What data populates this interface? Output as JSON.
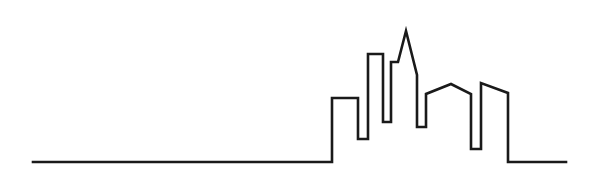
{
  "artwork": {
    "title": "City Skyline Continuous Line Drawing",
    "subject": "city-skyline",
    "style": "single-stroke-outline",
    "background_color": "#ffffff",
    "stroke_color": "#1a1a1a",
    "stroke_width": 2.6,
    "canvas": {
      "width": 609,
      "height": 194
    },
    "ground_line": {
      "label": "ground-baseline",
      "y": 162,
      "x_start": 33,
      "x_end": 566
    },
    "buildings": [
      {
        "name": "flat-low-block",
        "shape": "flat-top rectangle",
        "left_x": 332,
        "right_x": 358,
        "top_y": 98,
        "base_y": 162
      },
      {
        "name": "tall-slim-tower",
        "shape": "flat-top narrow tower",
        "left_x": 368,
        "right_x": 383,
        "top_y": 54,
        "base_y": 139
      },
      {
        "name": "thin-spike-tower",
        "shape": "very narrow flat-top tower",
        "left_x": 391,
        "right_x": 398,
        "top_y": 62,
        "base_y": 122
      },
      {
        "name": "pointed-spire-tower",
        "shape": "tapered spire with pointed apex",
        "apex_x": 406,
        "apex_y": 31,
        "left_x": 398,
        "right_x": 417,
        "base_y": 127
      },
      {
        "name": "pitched-roof-building",
        "shape": "shallow gabled roof",
        "left_x": 426,
        "right_x": 471,
        "peak_x": 451,
        "peak_y": 84,
        "eave_left_y": 94,
        "eave_right_y": 94,
        "base_y": 149
      },
      {
        "name": "sloped-top-end-building",
        "shape": "slanted flat roof",
        "left_x": 481,
        "right_x": 508,
        "top_left_y": 83,
        "top_right_y": 93,
        "base_y": 162
      }
    ],
    "path_d": "M 33 162 L 332 162 L 332 98 L 358 98 L 358 139 L 368 139 L 368 54 L 383 54 L 383 122 L 391 122 L 391 62 L 398 62 L 406 31 L 417 75 L 417 127 L 426 127 L 426 94 L 451 84 L 471 94 L 471 149 L 481 149 L 481 83 L 508 93 L 508 162 L 566 162"
  }
}
